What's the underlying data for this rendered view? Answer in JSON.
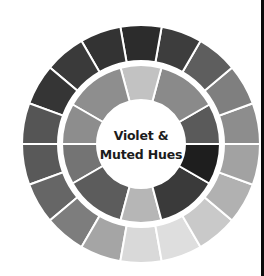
{
  "diagram": {
    "type": "color-wheel",
    "title_line1": "Violet &",
    "title_line2": "Muted Hues",
    "center": [
      141,
      144
    ],
    "outer_ring": {
      "r_outer": 119,
      "r_inner": 83,
      "segment_angles_deg": [
        0,
        20,
        40,
        60,
        80,
        100,
        120,
        140,
        160,
        180,
        200,
        220,
        240,
        260,
        280,
        300,
        320,
        340,
        360
      ],
      "colors": [
        "#8d8d8d",
        "#7f7f7f",
        "#5e5e5e",
        "#3d3d3d",
        "#2c2c2c",
        "#333333",
        "#3a3a3a",
        "#353535",
        "#555555",
        "#595959",
        "#666666",
        "#7d7d7d",
        "#a5a5a5",
        "#d9d9d9",
        "#dedede",
        "#c9c9c9",
        "#b1b1b1",
        "#a2a2a2"
      ]
    },
    "inner_ring": {
      "r_outer": 79,
      "r_inner": 44,
      "segment_angles_deg": [
        0,
        30,
        75,
        105,
        150,
        180,
        210,
        255,
        285,
        330,
        360
      ],
      "colors": [
        "#5a5a5a",
        "#8a8a8a",
        "#c2c2c2",
        "#8e8e8e",
        "#8d8d8d",
        "#747474",
        "#5c5c5c",
        "#b6b6b6",
        "#3a3a3a",
        "#1e1e1e"
      ]
    },
    "divider_color": "#ffffff",
    "center_fill": "#ffffff"
  },
  "frame": {
    "right_rule_color": "#0a0a0a"
  }
}
